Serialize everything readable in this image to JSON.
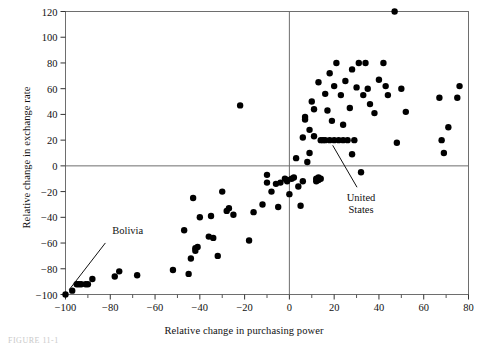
{
  "chart_data": {
    "type": "scatter",
    "title": "",
    "xlabel": "Relative change in purchasing power",
    "ylabel": "Relative change in exchange rate",
    "xlim": [
      -100,
      80
    ],
    "ylim": [
      -100,
      120
    ],
    "x_ticks": [
      -100,
      -80,
      -60,
      -40,
      -20,
      0,
      20,
      40,
      60,
      80
    ],
    "y_ticks": [
      -100,
      -80,
      -60,
      -40,
      -20,
      0,
      20,
      40,
      60,
      80,
      100,
      120
    ],
    "x_tick_labels": [
      "-100",
      "-80",
      "-60",
      "-40",
      "-20",
      "0",
      "20",
      "40",
      "60",
      "80"
    ],
    "y_tick_labels": [
      "-100",
      "-80",
      "-60",
      "-40",
      "-20",
      "0",
      "20",
      "40",
      "60",
      "80",
      "100",
      "120"
    ],
    "x_minor_tick_step": 10,
    "grid": false,
    "reference_lines": [
      {
        "axis": "x",
        "value": 0
      },
      {
        "axis": "y",
        "value": 0
      }
    ],
    "legend": null,
    "marker_color": "#000000",
    "marker_size_px": 4.6,
    "points": [
      [
        -100,
        -100
      ],
      [
        -97,
        -97
      ],
      [
        -95,
        -92
      ],
      [
        -94,
        -92
      ],
      [
        -93,
        -92
      ],
      [
        -91,
        -92
      ],
      [
        -90,
        -92
      ],
      [
        -88,
        -88
      ],
      [
        -78,
        -86
      ],
      [
        -76,
        -82
      ],
      [
        -68,
        -85
      ],
      [
        -52,
        -81
      ],
      [
        -47,
        -50
      ],
      [
        -45,
        -84
      ],
      [
        -44,
        -72
      ],
      [
        -43,
        -25
      ],
      [
        -42,
        -64
      ],
      [
        -42,
        -66
      ],
      [
        -41,
        -63
      ],
      [
        -40,
        -40
      ],
      [
        -36,
        -55
      ],
      [
        -35,
        -39
      ],
      [
        -34,
        -56
      ],
      [
        -32,
        -70
      ],
      [
        -30,
        -20
      ],
      [
        -28,
        -35
      ],
      [
        -27,
        -33
      ],
      [
        -25,
        -38
      ],
      [
        -22,
        47
      ],
      [
        -18,
        -58
      ],
      [
        -16,
        -36
      ],
      [
        -12,
        -30
      ],
      [
        -10,
        -13
      ],
      [
        -10,
        -7
      ],
      [
        -8,
        -20
      ],
      [
        -6,
        -14
      ],
      [
        -5,
        -32
      ],
      [
        -4,
        -13
      ],
      [
        -2,
        -10
      ],
      [
        -1,
        -11
      ],
      [
        -1,
        -12
      ],
      [
        0,
        -22
      ],
      [
        1,
        -10
      ],
      [
        2,
        -9
      ],
      [
        3,
        6
      ],
      [
        4,
        -16
      ],
      [
        5,
        -31
      ],
      [
        6,
        22
      ],
      [
        6,
        -12
      ],
      [
        7,
        38
      ],
      [
        7,
        36
      ],
      [
        8,
        3
      ],
      [
        9,
        28
      ],
      [
        9,
        10
      ],
      [
        10,
        50
      ],
      [
        11,
        23
      ],
      [
        11,
        44
      ],
      [
        12,
        -10
      ],
      [
        12,
        -12
      ],
      [
        13,
        -9
      ],
      [
        13,
        -11
      ],
      [
        13,
        65
      ],
      [
        14,
        -10
      ],
      [
        14,
        20
      ],
      [
        15,
        20
      ],
      [
        16,
        20
      ],
      [
        16,
        56
      ],
      [
        17,
        43
      ],
      [
        18,
        20
      ],
      [
        18,
        72
      ],
      [
        19,
        35
      ],
      [
        20,
        20
      ],
      [
        20,
        62
      ],
      [
        21,
        80
      ],
      [
        22,
        20
      ],
      [
        23,
        55
      ],
      [
        24,
        20
      ],
      [
        24,
        32
      ],
      [
        25,
        66
      ],
      [
        26,
        20
      ],
      [
        27,
        45
      ],
      [
        28,
        9
      ],
      [
        28,
        75
      ],
      [
        29,
        20
      ],
      [
        30,
        61
      ],
      [
        31,
        80
      ],
      [
        32,
        -5
      ],
      [
        33,
        55
      ],
      [
        34,
        80
      ],
      [
        35,
        60
      ],
      [
        36,
        48
      ],
      [
        38,
        41
      ],
      [
        40,
        67
      ],
      [
        42,
        80
      ],
      [
        43,
        62
      ],
      [
        44,
        55
      ],
      [
        47,
        120
      ],
      [
        48,
        18
      ],
      [
        50,
        60
      ],
      [
        52,
        42
      ],
      [
        67,
        53
      ],
      [
        68,
        20
      ],
      [
        69,
        10
      ],
      [
        75,
        53
      ],
      [
        76,
        62
      ],
      [
        71,
        30
      ]
    ],
    "annotations": [
      {
        "label": "Bolivia",
        "label_lines": [
          "Bolivia"
        ],
        "point": [
          -100,
          -100
        ],
        "label_x": -80,
        "label_y": -55
      },
      {
        "label": "United States",
        "label_lines": [
          "United",
          "States"
        ],
        "point": [
          18,
          20
        ],
        "label_x": 32,
        "label_y": -22
      }
    ]
  },
  "figure": {
    "caption_fragment": "FIGURE 11-1"
  }
}
